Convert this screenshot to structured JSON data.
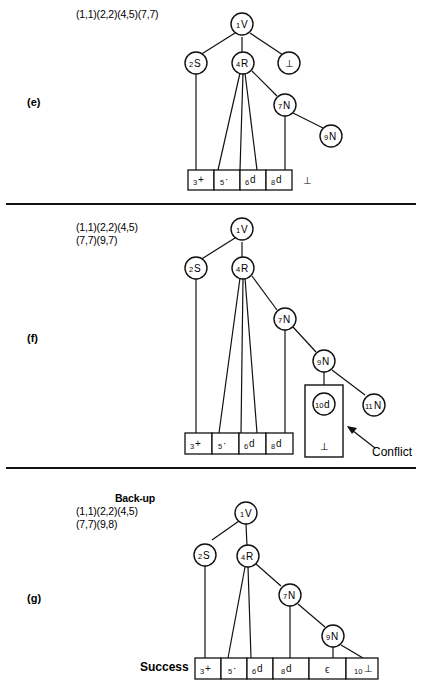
{
  "figure": {
    "background": "#ffffff",
    "stroke": "#111111"
  },
  "panels": [
    {
      "id": "e",
      "label": "(e)",
      "caption_lines": [
        "(1,1)(2,2)(4,5)(7,7)"
      ],
      "caption_bold_first": false,
      "side_note": "",
      "nodes": [
        {
          "id": "n1",
          "num": "1",
          "sym": "V"
        },
        {
          "id": "n2",
          "num": "2",
          "sym": "S"
        },
        {
          "id": "n4",
          "num": "4",
          "sym": "R"
        },
        {
          "id": "nb",
          "num": "",
          "sym": "⊥"
        },
        {
          "id": "n7",
          "num": "7",
          "sym": "N"
        },
        {
          "id": "n9",
          "num": "9",
          "sym": "N"
        }
      ],
      "cells": [
        {
          "num": "3",
          "sym": "+"
        },
        {
          "num": "5",
          "sym": "·"
        },
        {
          "num": "6",
          "sym": "d"
        },
        {
          "num": "8",
          "sym": "d"
        }
      ],
      "trailing_symbol": "⊥",
      "conflict": null
    },
    {
      "id": "f",
      "label": "(f)",
      "caption_lines": [
        "(1,1)(2,2)(4,5)",
        "(7,7)(9,7)"
      ],
      "caption_bold_first": false,
      "side_note": "Conflict",
      "nodes": [
        {
          "id": "n1",
          "num": "1",
          "sym": "V"
        },
        {
          "id": "n2",
          "num": "2",
          "sym": "S"
        },
        {
          "id": "n4",
          "num": "4",
          "sym": "R"
        },
        {
          "id": "n7",
          "num": "7",
          "sym": "N"
        },
        {
          "id": "n9",
          "num": "9",
          "sym": "N"
        },
        {
          "id": "n10",
          "num": "10",
          "sym": "d"
        },
        {
          "id": "n11",
          "num": "11",
          "sym": "N"
        }
      ],
      "cells": [
        {
          "num": "3",
          "sym": "+"
        },
        {
          "num": "5",
          "sym": "·"
        },
        {
          "num": "6",
          "sym": "d"
        },
        {
          "num": "8",
          "sym": "d"
        }
      ],
      "trailing_symbol": "",
      "conflict": {
        "label": "Conflict",
        "box_symbol": "⊥",
        "inner_node": {
          "num": "10",
          "sym": "d"
        }
      }
    },
    {
      "id": "g",
      "label": "(g)",
      "caption_lines": [
        "Back-up",
        "(1,1)(2,2)(4,5)",
        "(7,7)(9,8)"
      ],
      "caption_bold_first": true,
      "side_note": "Success",
      "nodes": [
        {
          "id": "n1",
          "num": "1",
          "sym": "V"
        },
        {
          "id": "n2",
          "num": "2",
          "sym": "S"
        },
        {
          "id": "n4",
          "num": "4",
          "sym": "R"
        },
        {
          "id": "n7",
          "num": "7",
          "sym": "N"
        },
        {
          "id": "n9",
          "num": "9",
          "sym": "N"
        }
      ],
      "cells": [
        {
          "num": "3",
          "sym": "+"
        },
        {
          "num": "5",
          "sym": "·"
        },
        {
          "num": "6",
          "sym": "d"
        },
        {
          "num": "8",
          "sym": "d"
        },
        {
          "num": "",
          "sym": "ϵ"
        },
        {
          "num": "10",
          "sym": "⊥"
        }
      ],
      "trailing_symbol": "",
      "conflict": null
    }
  ],
  "labels": {
    "panel_e": "(e)",
    "panel_f": "(f)",
    "panel_g": "(g)",
    "caption_e_l1": "(1,1)(2,2)(4,5)(7,7)",
    "caption_f_l1": "(1,1)(2,2)(4,5)",
    "caption_f_l2": "(7,7)(9,7)",
    "caption_g_l0": "Back-up",
    "caption_g_l1": "(1,1)(2,2)(4,5)",
    "caption_g_l2": "(7,7)(9,8)",
    "conflict_note": "Conflict",
    "success_note": "Success",
    "bottom_symbol": "⊥"
  },
  "node_text": {
    "e": {
      "n1_num": "1",
      "n1_sym": "V",
      "n2_num": "2",
      "n2_sym": "S",
      "n4_num": "4",
      "n4_sym": "R",
      "nb_sym": "⊥",
      "n7_num": "7",
      "n7_sym": "N",
      "n9_num": "9",
      "n9_sym": "N",
      "c1_num": "3",
      "c1_sym": "+",
      "c2_num": "5",
      "c2_sym": "·",
      "c3_num": "6",
      "c3_sym": "d",
      "c4_num": "8",
      "c4_sym": "d",
      "tail": "⊥"
    },
    "f": {
      "n1_num": "1",
      "n1_sym": "V",
      "n2_num": "2",
      "n2_sym": "S",
      "n4_num": "4",
      "n4_sym": "R",
      "n7_num": "7",
      "n7_sym": "N",
      "n9_num": "9",
      "n9_sym": "N",
      "n10_num": "10",
      "n10_sym": "d",
      "n11_num": "11",
      "n11_sym": "N",
      "c1_num": "3",
      "c1_sym": "+",
      "c2_num": "5",
      "c2_sym": "·",
      "c3_num": "6",
      "c3_sym": "d",
      "c4_num": "8",
      "c4_sym": "d",
      "conflict_box_sym": "⊥",
      "conflict_label": "Conflict"
    },
    "g": {
      "n1_num": "1",
      "n1_sym": "V",
      "n2_num": "2",
      "n2_sym": "S",
      "n4_num": "4",
      "n4_sym": "R",
      "n7_num": "7",
      "n7_sym": "N",
      "n9_num": "9",
      "n9_sym": "N",
      "c1_num": "3",
      "c1_sym": "+",
      "c2_num": "5",
      "c2_sym": "·",
      "c3_num": "6",
      "c3_sym": "d",
      "c4_num": "8",
      "c4_sym": "d",
      "c5_num": "",
      "c5_sym": "ϵ",
      "c6_num": "10",
      "c6_sym": "⊥",
      "success_label": "Success"
    }
  }
}
